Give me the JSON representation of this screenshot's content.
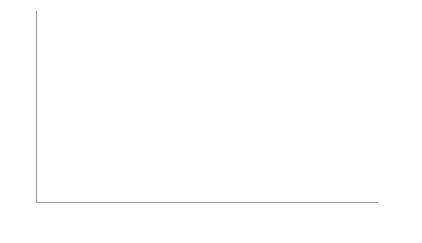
{
  "chart_data": {
    "type": "bar",
    "stacked": true,
    "title": "",
    "subtitle": "",
    "xlabel": "",
    "ylabel": "Population, millions",
    "ylim": [
      0.0,
      10.0
    ],
    "ytick_labels": [
      "0.00",
      "1.00",
      "2.00",
      "3.00",
      "4.00",
      "5.00",
      "6.00",
      "7.00",
      "8.00",
      "9.00",
      "10.00"
    ],
    "ytick_values": [
      0,
      1,
      2,
      3,
      4,
      5,
      6,
      7,
      8,
      9,
      10
    ],
    "grid": true,
    "grid_axis": "y",
    "legend_position": "bottom",
    "colors": {
      "aged_10_14": "#b2b2b2",
      "aged_15_19": "#595959"
    },
    "xtick_labels": [
      "1950",
      "1955",
      "1960",
      "1965",
      "1970",
      "1975",
      "1980",
      "1985",
      "1990",
      "1995",
      "2000",
      "2005",
      "2010",
      "2015",
      "2020",
      "2025",
      "2030"
    ],
    "xtick_rotation": -90,
    "categories": [
      "1950",
      "1951",
      "1952",
      "1953",
      "1954",
      "1955",
      "1956",
      "1957",
      "1958",
      "1959",
      "1960",
      "1961",
      "1962",
      "1963",
      "1964",
      "1965",
      "1966",
      "1967",
      "1968",
      "1969",
      "1970",
      "1971",
      "1972",
      "1973",
      "1974",
      "1975",
      "1976",
      "1977",
      "1978",
      "1979",
      "1980",
      "1981",
      "1982",
      "1983",
      "1984",
      "1985",
      "1986",
      "1987",
      "1988",
      "1989",
      "1990",
      "1991",
      "1992",
      "1993",
      "1994",
      "1995",
      "1996",
      "1997",
      "1998",
      "1999",
      "2000",
      "2001",
      "2002",
      "2003",
      "2004",
      "2005",
      "2006",
      "2007",
      "2008",
      "2009",
      "2010",
      "2011",
      "2012",
      "2013",
      "2014",
      "2015",
      "2016",
      "2017",
      "2018",
      "2019",
      "2020",
      "2021",
      "2022",
      "2023",
      "2024",
      "2025",
      "2026",
      "2027",
      "2028",
      "2029",
      "2030"
    ],
    "series": [
      {
        "name": "Population aged 10-14",
        "color": "#b2b2b2",
        "values": [
          3.27,
          3.3,
          3.35,
          3.42,
          3.52,
          3.62,
          3.72,
          3.8,
          3.9,
          4.0,
          4.1,
          4.16,
          4.18,
          4.18,
          4.16,
          4.14,
          4.12,
          4.12,
          4.14,
          4.18,
          4.22,
          4.27,
          4.32,
          4.37,
          4.42,
          4.47,
          4.52,
          4.57,
          4.6,
          4.62,
          4.62,
          4.58,
          4.5,
          4.4,
          4.28,
          4.15,
          4.02,
          3.92,
          3.84,
          3.78,
          3.72,
          3.68,
          3.65,
          3.63,
          3.63,
          3.64,
          3.66,
          3.7,
          3.74,
          3.78,
          3.82,
          3.85,
          3.87,
          3.88,
          3.88,
          3.86,
          3.83,
          3.79,
          3.74,
          3.68,
          3.62,
          3.56,
          3.5,
          3.46,
          3.44,
          3.45,
          3.5,
          3.57,
          3.65,
          3.72,
          3.78,
          3.84,
          3.88,
          3.92,
          3.95,
          3.97,
          3.99,
          4.0,
          4.01,
          4.01,
          4.01
        ]
      },
      {
        "name": "Population aged 15-19",
        "color": "#595959",
        "values": [
          3.23,
          3.1,
          3.0,
          2.98,
          3.0,
          3.06,
          3.14,
          3.26,
          3.4,
          3.55,
          3.7,
          3.82,
          3.88,
          3.88,
          3.82,
          3.76,
          3.74,
          3.74,
          3.76,
          3.8,
          3.86,
          3.94,
          4.04,
          4.16,
          4.28,
          4.4,
          4.52,
          4.6,
          4.62,
          4.58,
          4.54,
          4.5,
          4.42,
          4.28,
          4.1,
          3.88,
          3.68,
          3.52,
          3.4,
          3.32,
          3.28,
          3.26,
          3.26,
          3.28,
          3.32,
          3.38,
          3.46,
          3.54,
          3.6,
          3.66,
          3.72,
          3.78,
          3.83,
          3.86,
          3.86,
          3.84,
          3.8,
          3.76,
          3.72,
          3.7,
          3.7,
          3.7,
          3.68,
          3.64,
          3.6,
          3.6,
          3.62,
          3.66,
          3.72,
          3.78,
          3.84,
          3.9,
          3.95,
          4.0,
          4.03,
          4.06,
          4.08,
          4.09,
          4.1,
          4.1,
          4.1
        ]
      }
    ]
  },
  "legend": {
    "items": [
      {
        "label": "Population aged 10-14",
        "color": "#b2b2b2"
      },
      {
        "label": "Population aged 15-19",
        "color": "#595959"
      }
    ]
  }
}
